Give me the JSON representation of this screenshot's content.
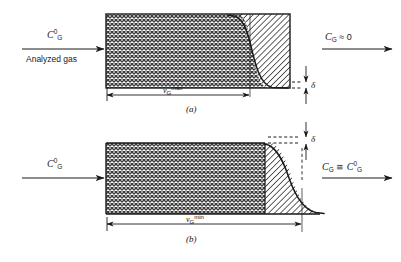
{
  "figure": {
    "type": "technical-diagram",
    "panels": [
      {
        "tag": "(a)",
        "inlet_label": "C",
        "inlet_sub": "G",
        "inlet_sup": "0",
        "inlet_caption": "Analyzed gas",
        "outlet_label": "C",
        "outlet_sub": "G",
        "outlet_relation": "≈",
        "outlet_value": "0",
        "dimension_symbol": "v",
        "dimension_sub": "G",
        "dimension_sup": "max",
        "delta_symbol": "δ"
      },
      {
        "tag": "(b)",
        "inlet_label": "C",
        "inlet_sub": "G",
        "inlet_sup": "0",
        "inlet_caption": "",
        "outlet_label": "C",
        "outlet_sub": "G",
        "outlet_relation": "≅",
        "outlet_value": "C",
        "outlet_value_sub": "G",
        "outlet_value_sup": "0",
        "dimension_symbol": "v",
        "dimension_sub": "G",
        "dimension_sup": "min",
        "delta_symbol": "δ"
      }
    ]
  },
  "colors": {
    "stroke": "#1a1a1a",
    "background": "#ffffff",
    "crosshatch": "#3a3a3a",
    "diagonal": "#2b2b2b"
  }
}
